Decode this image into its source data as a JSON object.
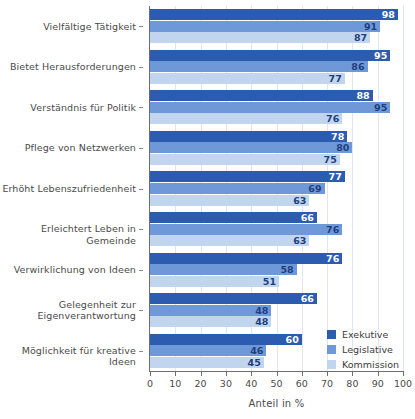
{
  "chart_data": {
    "type": "bar",
    "orientation": "horizontal",
    "title": "",
    "subtitle": "",
    "xlabel": "Anteil in %",
    "ylabel": "",
    "xlim": [
      0,
      100
    ],
    "xticks": [
      0,
      10,
      20,
      30,
      40,
      50,
      60,
      70,
      80,
      90,
      100
    ],
    "xticklabels": [
      "0",
      "10",
      "20",
      "30",
      "40",
      "50",
      "60",
      "70",
      "80",
      "90",
      "100"
    ],
    "grid": "vertical-light",
    "legend_position": "lower-right-inside",
    "categories": [
      "Vielfältige Tätigkeit",
      "Bietet Herausforderungen",
      "Verständnis für Politik",
      "Pflege von Netzwerken",
      "Erhöht Lebenszufriedenheit",
      "Erleichtert Leben in Gemeinde",
      "Verwirklichung von Ideen",
      "Gelegenheit zur\nEigenverantwortung",
      "Möglichkeit für kreative Ideen"
    ],
    "series": [
      {
        "name": "Exekutive",
        "color": "#2b5cb0",
        "values": [
          98,
          95,
          88,
          78,
          77,
          66,
          76,
          66,
          60
        ]
      },
      {
        "name": "Legislative",
        "color": "#6f98d9",
        "values": [
          91,
          86,
          95,
          80,
          69,
          76,
          58,
          48,
          46
        ]
      },
      {
        "name": "Kommission",
        "color": "#c2d5ef",
        "values": [
          87,
          77,
          76,
          75,
          63,
          63,
          51,
          48,
          45
        ]
      }
    ]
  },
  "legend": {
    "items": [
      {
        "label": "Exekutive",
        "color": "#2b5cb0"
      },
      {
        "label": "Legislative",
        "color": "#6f98d9"
      },
      {
        "label": "Kommission",
        "color": "#c2d5ef"
      }
    ]
  },
  "axis": {
    "x_title": "Anteil in %"
  }
}
